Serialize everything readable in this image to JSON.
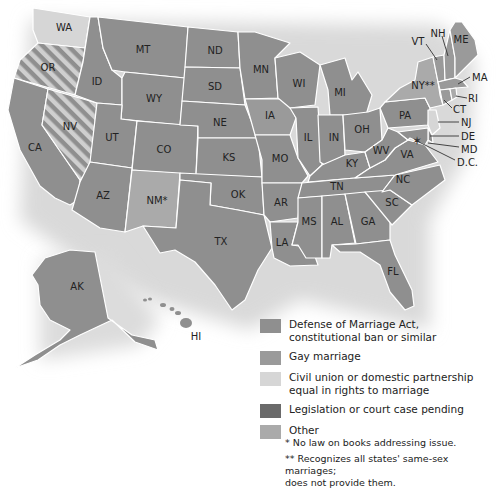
{
  "colors": {
    "doma": "#8f8f8f",
    "gay_marriage": "#9a9a9a",
    "civil_union": "#d6d6d6",
    "pending": "#6a6a6a",
    "other": "#aaaaaa",
    "stripe_light": "#cfcfcf",
    "stripe_dark": "#8f8f8f",
    "shadow": "#e4e4e4",
    "border": "#ffffff"
  },
  "states": [
    {
      "abbr": "WA",
      "category": "civil_union"
    },
    {
      "abbr": "OR",
      "category": "striped"
    },
    {
      "abbr": "CA",
      "category": "doma"
    },
    {
      "abbr": "NV",
      "category": "striped"
    },
    {
      "abbr": "ID",
      "category": "doma"
    },
    {
      "abbr": "MT",
      "category": "doma"
    },
    {
      "abbr": "WY",
      "category": "doma"
    },
    {
      "abbr": "UT",
      "category": "doma"
    },
    {
      "abbr": "AZ",
      "category": "doma"
    },
    {
      "abbr": "CO",
      "category": "doma"
    },
    {
      "abbr": "NM*",
      "category": "other"
    },
    {
      "abbr": "ND",
      "category": "doma"
    },
    {
      "abbr": "SD",
      "category": "doma"
    },
    {
      "abbr": "NE",
      "category": "doma"
    },
    {
      "abbr": "KS",
      "category": "doma"
    },
    {
      "abbr": "OK",
      "category": "doma"
    },
    {
      "abbr": "TX",
      "category": "doma"
    },
    {
      "abbr": "MN",
      "category": "doma"
    },
    {
      "abbr": "IA",
      "category": "gay_marriage"
    },
    {
      "abbr": "MO",
      "category": "doma"
    },
    {
      "abbr": "AR",
      "category": "doma"
    },
    {
      "abbr": "LA",
      "category": "doma"
    },
    {
      "abbr": "WI",
      "category": "doma"
    },
    {
      "abbr": "IL",
      "category": "doma"
    },
    {
      "abbr": "MI",
      "category": "doma"
    },
    {
      "abbr": "IN",
      "category": "doma"
    },
    {
      "abbr": "OH",
      "category": "doma"
    },
    {
      "abbr": "KY",
      "category": "doma"
    },
    {
      "abbr": "TN",
      "category": "doma"
    },
    {
      "abbr": "MS",
      "category": "doma"
    },
    {
      "abbr": "AL",
      "category": "doma"
    },
    {
      "abbr": "GA",
      "category": "doma"
    },
    {
      "abbr": "FL",
      "category": "doma"
    },
    {
      "abbr": "SC",
      "category": "doma"
    },
    {
      "abbr": "NC",
      "category": "doma"
    },
    {
      "abbr": "VA",
      "category": "doma"
    },
    {
      "abbr": "WV",
      "category": "doma"
    },
    {
      "abbr": "PA",
      "category": "doma"
    },
    {
      "abbr": "NY**",
      "category": "other"
    },
    {
      "abbr": "VT",
      "category": "gay_marriage"
    },
    {
      "abbr": "NH",
      "category": "gay_marriage"
    },
    {
      "abbr": "ME",
      "category": "gay_marriage"
    },
    {
      "abbr": "MA",
      "category": "gay_marriage"
    },
    {
      "abbr": "RI",
      "category": "other"
    },
    {
      "abbr": "CT",
      "category": "gay_marriage"
    },
    {
      "abbr": "NJ",
      "category": "civil_union"
    },
    {
      "abbr": "DE",
      "category": "doma"
    },
    {
      "abbr": "MD",
      "category": "doma"
    },
    {
      "abbr": "D.C.",
      "category": "gay_marriage"
    },
    {
      "abbr": "AK",
      "category": "doma"
    },
    {
      "abbr": "HI",
      "category": "doma"
    }
  ],
  "labels": {
    "WA": "WA",
    "OR": "OR",
    "CA": "CA",
    "NV": "NV",
    "ID": "ID",
    "MT": "MT",
    "WY": "WY",
    "UT": "UT",
    "AZ": "AZ",
    "CO": "CO",
    "NM": "NM*",
    "ND": "ND",
    "SD": "SD",
    "NE": "NE",
    "KS": "KS",
    "OK": "OK",
    "TX": "TX",
    "MN": "MN",
    "IA": "IA",
    "MO": "MO",
    "AR": "AR",
    "LA": "LA",
    "WI": "WI",
    "IL": "IL",
    "MI": "MI",
    "IN": "IN",
    "OH": "OH",
    "KY": "KY",
    "TN": "TN",
    "MS": "MS",
    "AL": "AL",
    "GA": "GA",
    "FL": "FL",
    "SC": "SC",
    "NC": "NC",
    "VA": "VA",
    "WV": "WV",
    "PA": "PA",
    "NY": "NY**",
    "VT": "VT",
    "NH": "NH",
    "ME": "ME",
    "MA": "MA",
    "RI": "RI",
    "CT": "CT",
    "NJ": "NJ",
    "DE": "DE",
    "MD": "MD",
    "DC": "D.C.",
    "AK": "AK",
    "HI": "HI"
  },
  "legend": [
    {
      "key": "doma",
      "label": "Defense of Marriage Act, constitutional ban or similar"
    },
    {
      "key": "gay_marriage",
      "label": "Gay marriage"
    },
    {
      "key": "civil_union",
      "label": "Civil union or domestic partnership equal in rights to marriage"
    },
    {
      "key": "pending",
      "label": "Legislation or court case pending"
    },
    {
      "key": "other",
      "label": "Other"
    }
  ],
  "legend_labels": {
    "doma_1": "Defense of Marriage Act,",
    "doma_2": "constitutional ban or similar",
    "gay_marriage": "Gay marriage",
    "civil_1": "Civil union or domestic partnership",
    "civil_2": "equal in rights to marriage",
    "pending": "Legislation or court case pending",
    "other": "Other"
  },
  "notes": {
    "single_star": "* No law on books addressing issue.",
    "double_star_1": "** Recognizes all states' same-sex marriages;",
    "double_star_2": "does not provide them."
  }
}
